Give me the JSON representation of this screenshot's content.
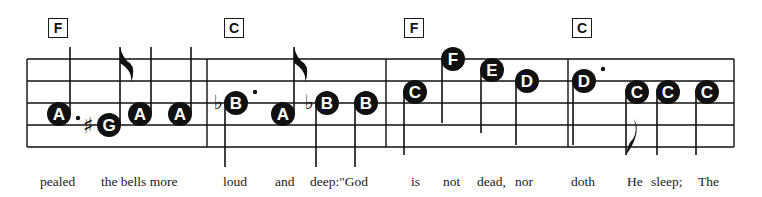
{
  "colors": {
    "ink": "#111111",
    "paper": "#ffffff",
    "note_text": "#ffffff"
  },
  "measures": [
    {
      "chord": "F",
      "notes": [
        {
          "name": "A",
          "pitch": "A4",
          "duration": "dotted-quarter",
          "dotted": true,
          "stem": "up"
        },
        {
          "name": "G",
          "pitch": "G4",
          "accidental": "sharp",
          "duration": "eighth",
          "stem": "up-flag"
        },
        {
          "name": "A",
          "pitch": "A4",
          "duration": "quarter",
          "stem": "up"
        },
        {
          "name": "A",
          "pitch": "A4",
          "duration": "quarter",
          "stem": "up"
        }
      ]
    },
    {
      "chord": "C",
      "notes": [
        {
          "name": "B",
          "pitch": "Bb4",
          "accidental": "flat",
          "duration": "dotted-quarter",
          "dotted": true,
          "stem": "down"
        },
        {
          "name": "A",
          "pitch": "A4",
          "duration": "eighth",
          "stem": "up-flag"
        },
        {
          "name": "B",
          "pitch": "Bb4",
          "accidental": "flat",
          "duration": "quarter",
          "stem": "down"
        },
        {
          "name": "B",
          "pitch": "Bb4",
          "duration": "quarter",
          "stem": "down"
        }
      ]
    },
    {
      "chord": "F",
      "notes": [
        {
          "name": "C",
          "pitch": "C5",
          "duration": "quarter",
          "stem": "down"
        },
        {
          "name": "F",
          "pitch": "F5",
          "duration": "quarter",
          "stem": "down"
        },
        {
          "name": "E",
          "pitch": "E5",
          "duration": "quarter",
          "stem": "down"
        },
        {
          "name": "D",
          "pitch": "D5",
          "duration": "quarter",
          "stem": "down"
        }
      ]
    },
    {
      "chord": "C",
      "notes": [
        {
          "name": "D",
          "pitch": "D5",
          "duration": "dotted-quarter",
          "dotted": true,
          "stem": "down"
        },
        {
          "name": "C",
          "pitch": "C5",
          "duration": "eighth",
          "stem": "down-flag"
        },
        {
          "name": "C",
          "pitch": "C5",
          "duration": "quarter",
          "stem": "down"
        },
        {
          "name": "C",
          "pitch": "C5",
          "duration": "quarter",
          "stem": "down"
        }
      ]
    }
  ],
  "lyrics": [
    "pealed",
    "the bells more",
    "loud",
    "and",
    "deep:\"God",
    "is",
    "not",
    "dead,",
    "nor",
    "doth",
    "He",
    "sleep;",
    "The"
  ]
}
